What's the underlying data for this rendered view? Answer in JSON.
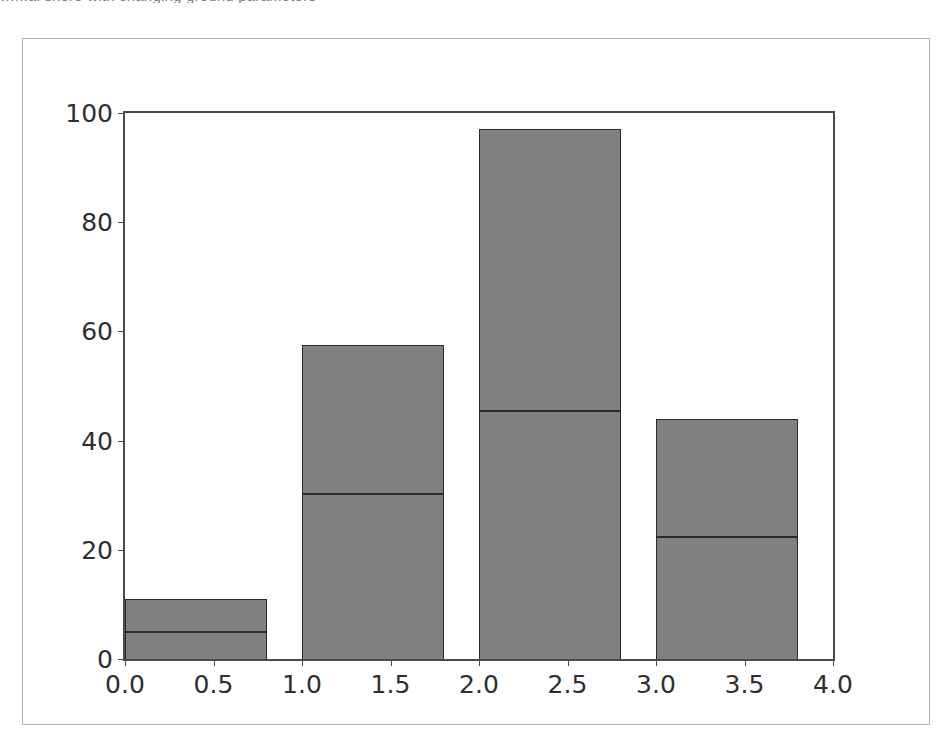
{
  "page": {
    "clipped_top_text": "…mal shore with changing ground parameters",
    "background_color": "#ffffff"
  },
  "figure": {
    "frame_color": "#b4b4b4",
    "axes_color": "#4a4a4a",
    "bar_fill_color": "#808080",
    "bar_edge_color": "#2b2b2b"
  },
  "chart_data": {
    "type": "bar",
    "stacked": true,
    "title": "",
    "xlabel": "",
    "ylabel": "",
    "xlim": [
      0.0,
      4.0
    ],
    "ylim": [
      0,
      100
    ],
    "grid": false,
    "legend": null,
    "bar_width": 0.8,
    "bar_align": "edge",
    "x": [
      0.0,
      1.0,
      2.0,
      3.0
    ],
    "xticks": [
      0.0,
      0.5,
      1.0,
      1.5,
      2.0,
      2.5,
      3.0,
      3.5,
      4.0
    ],
    "xticklabels": [
      "0.0",
      "0.5",
      "1.0",
      "1.5",
      "2.0",
      "2.5",
      "3.0",
      "3.5",
      "4.0"
    ],
    "yticks": [
      0,
      20,
      40,
      60,
      80,
      100
    ],
    "yticklabels": [
      "0",
      "20",
      "40",
      "60",
      "80",
      "100"
    ],
    "series": [
      {
        "name": "lower",
        "values": [
          5.0,
          30.3,
          45.5,
          22.4
        ]
      },
      {
        "name": "upper",
        "values": [
          6.0,
          27.2,
          51.5,
          21.6
        ]
      }
    ],
    "totals": [
      11.0,
      57.5,
      97.0,
      44.0
    ]
  }
}
